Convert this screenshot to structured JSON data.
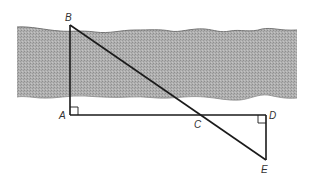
{
  "diagram": {
    "colors": {
      "river_fill": "#a8a8a8",
      "river_edge": "#6a6a6a",
      "line": "#1a1a1a",
      "label": "#333333",
      "background": "#ffffff"
    },
    "points": {
      "B": {
        "label": "B",
        "x": 70,
        "y": 25
      },
      "A": {
        "label": "A",
        "x": 70,
        "y": 115
      },
      "C": {
        "label": "C",
        "x": 180,
        "y": 115
      },
      "D": {
        "label": "D",
        "x": 266,
        "y": 115
      },
      "E": {
        "label": "E",
        "x": 266,
        "y": 160
      }
    },
    "segments": [
      "BA",
      "AD",
      "DE",
      "BE"
    ],
    "right_angles": [
      "A",
      "D"
    ],
    "regions": [
      {
        "name": "river",
        "type": "shaded band"
      }
    ]
  }
}
